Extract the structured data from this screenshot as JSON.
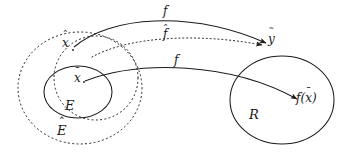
{
  "figure": {
    "kind": "set-mapping-diagram",
    "width": 342,
    "height": 160,
    "background": "#ffffff",
    "stroke_color": "#1b1b1b",
    "text_color": "#1b1b1b"
  },
  "regions": [
    {
      "id": "E-hat",
      "label": "E",
      "accent": "hat",
      "accent_glyph": "ˆ",
      "style": "dotted",
      "shape": "ellipse",
      "cx": 80,
      "cy": 88,
      "rx": 62,
      "ry": 56,
      "label_x": 60,
      "label_y": 128
    },
    {
      "id": "E-hat-overlap",
      "label": "",
      "accent": "none",
      "accent_glyph": "",
      "style": "dotted",
      "shape": "ellipse",
      "cx": 96,
      "cy": 78,
      "rx": 42,
      "ry": 42,
      "label_x": 0,
      "label_y": 0
    },
    {
      "id": "E",
      "label": "E",
      "accent": "none",
      "accent_glyph": "",
      "style": "solid",
      "shape": "ellipse",
      "cx": 78,
      "cy": 92,
      "rx": 34,
      "ry": 26,
      "label_x": 68,
      "label_y": 105
    },
    {
      "id": "R",
      "label": "R",
      "accent": "none",
      "accent_glyph": "",
      "style": "solid",
      "shape": "ellipse",
      "cx": 282,
      "cy": 100,
      "rx": 52,
      "ry": 44,
      "label_x": 252,
      "label_y": 115
    }
  ],
  "points": [
    {
      "id": "x-hat",
      "label": "x",
      "accent": "hat",
      "accent_glyph": "ˆ",
      "x": 72,
      "y": 48,
      "label_x": 65,
      "label_y": 46
    },
    {
      "id": "x-bar",
      "label": "x",
      "accent": "bar",
      "accent_glyph": "¯",
      "x": 84,
      "y": 82,
      "label_x": 76,
      "label_y": 79
    },
    {
      "id": "y-tilde",
      "label": "y",
      "accent": "bar",
      "accent_glyph": "˜",
      "x": 270,
      "y": 44,
      "label_x": 269,
      "label_y": 37
    },
    {
      "id": "f-of-x-bar",
      "label": "f(x)",
      "accent": "mixed",
      "accent_glyph": "¯",
      "x": 300,
      "y": 101,
      "label_x": 297,
      "label_y": 95
    }
  ],
  "arrows": [
    {
      "id": "arrow-f-top",
      "label": "f",
      "accent": "none",
      "accent_glyph": "",
      "style": "solid",
      "from": "x-hat",
      "to": "y-tilde",
      "path": "M 74 47 C 110 16, 190 10, 266 43",
      "label_x": 166,
      "label_y": 8
    },
    {
      "id": "arrow-f-hat",
      "label": "f",
      "accent": "hat",
      "accent_glyph": "ˆ",
      "style": "dotted",
      "from": "E-hat",
      "to": "y-tilde",
      "path": "M 92 57 C 130 36, 200 33, 264 45",
      "label_x": 166,
      "label_y": 31
    },
    {
      "id": "arrow-f-bottom",
      "label": "f",
      "accent": "none",
      "accent_glyph": "",
      "style": "solid",
      "from": "x-bar",
      "to": "f-of-x-bar",
      "path": "M 85 81 C 140 60, 230 62, 299 100",
      "label_x": 176,
      "label_y": 58
    }
  ]
}
